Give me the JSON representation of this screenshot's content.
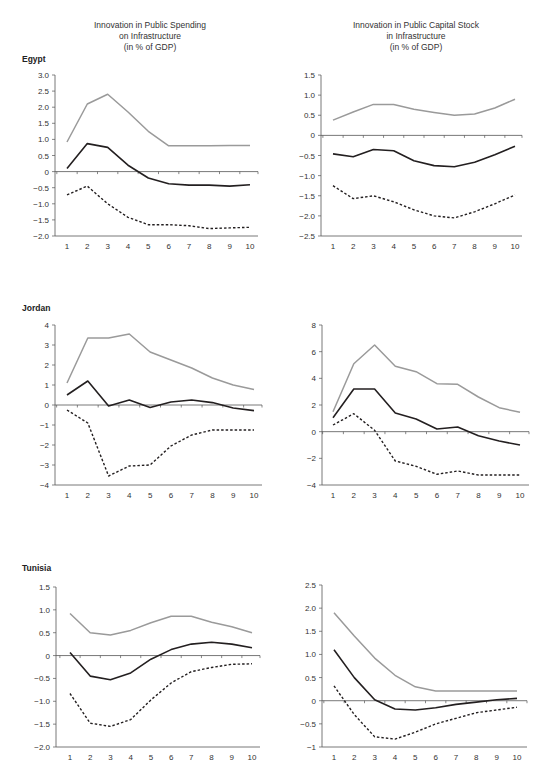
{
  "headers": {
    "left": [
      "Innovation in Public Spending",
      "on Infrastructure",
      "(in % of GDP)"
    ],
    "right": [
      "Innovation in Public Capital Stock",
      "in Infrastructure",
      "(in % of GDP)"
    ]
  },
  "countries": [
    "Egypt",
    "Jordan",
    "Tunisia"
  ],
  "colors": {
    "upper_band": "#9a9a9a",
    "estimate": "#231f20",
    "lower_band": "#231f20",
    "axis": "#555555"
  },
  "chart_data": [
    {
      "type": "line",
      "country": "Egypt",
      "panel": "Innovation in Public Spending on Infrastructure (in % of GDP)",
      "x": [
        1,
        2,
        3,
        4,
        5,
        6,
        7,
        8,
        9,
        10
      ],
      "ylim": [
        -2.0,
        3.0
      ],
      "yticks": [
        "3.0",
        "2.5",
        "2.0",
        "1.5",
        "1.0",
        "0.5",
        "0",
        "-0.5",
        "-1.0",
        "-1.5",
        "-2.0"
      ],
      "series": [
        {
          "name": "upper",
          "style": "gray",
          "values": [
            0.92,
            2.1,
            2.4,
            1.85,
            1.25,
            0.8,
            0.8,
            0.8,
            0.81,
            0.81
          ]
        },
        {
          "name": "estimate",
          "style": "solid",
          "values": [
            0.1,
            0.87,
            0.75,
            0.2,
            -0.2,
            -0.38,
            -0.42,
            -0.42,
            -0.45,
            -0.41
          ]
        },
        {
          "name": "lower",
          "style": "dashed",
          "values": [
            -0.72,
            -0.45,
            -1.0,
            -1.42,
            -1.65,
            -1.65,
            -1.68,
            -1.77,
            -1.75,
            -1.73
          ]
        }
      ],
      "frame": {
        "left": 55,
        "right": 258,
        "top": 75,
        "bottom": 236,
        "zero_line": true,
        "x_start": 67,
        "x_end": 250
      }
    },
    {
      "type": "line",
      "country": "Egypt",
      "panel": "Innovation in Public Capital Stock in Infrastructure (in % of GDP)",
      "x": [
        1,
        2,
        3,
        4,
        5,
        6,
        7,
        8,
        9,
        10
      ],
      "ylim": [
        -2.5,
        1.5
      ],
      "yticks": [
        "1.5",
        "1.0",
        "0.5",
        "0",
        "-0.5",
        "-1.0",
        "-1.5",
        "-2.0",
        "-2.5"
      ],
      "series": [
        {
          "name": "upper",
          "style": "gray",
          "values": [
            0.38,
            0.58,
            0.77,
            0.77,
            0.65,
            0.57,
            0.5,
            0.53,
            0.68,
            0.9
          ]
        },
        {
          "name": "estimate",
          "style": "solid",
          "values": [
            -0.46,
            -0.53,
            -0.35,
            -0.38,
            -0.63,
            -0.75,
            -0.78,
            -0.67,
            -0.48,
            -0.27
          ]
        },
        {
          "name": "lower",
          "style": "dashed",
          "values": [
            -1.25,
            -1.57,
            -1.5,
            -1.65,
            -1.85,
            -2.0,
            -2.05,
            -1.9,
            -1.7,
            -1.48
          ]
        }
      ],
      "frame": {
        "left": 321,
        "right": 522,
        "top": 75,
        "bottom": 236,
        "zero_line": true,
        "x_start": 333,
        "x_end": 515
      }
    },
    {
      "type": "line",
      "country": "Jordan",
      "panel": "Innovation in Public Spending on Infrastructure (in % of GDP)",
      "x": [
        1,
        2,
        3,
        4,
        5,
        6,
        7,
        8,
        9,
        10
      ],
      "ylim": [
        -4,
        4
      ],
      "yticks": [
        "4",
        "3",
        "2",
        "1",
        "0",
        "-1",
        "-2",
        "-3",
        "-4"
      ],
      "series": [
        {
          "name": "upper",
          "style": "gray",
          "values": [
            1.1,
            3.35,
            3.35,
            3.55,
            2.65,
            2.25,
            1.85,
            1.35,
            1.0,
            0.78
          ]
        },
        {
          "name": "estimate",
          "style": "solid",
          "values": [
            0.5,
            1.2,
            -0.05,
            0.25,
            -0.12,
            0.15,
            0.25,
            0.12,
            -0.15,
            -0.28
          ]
        },
        {
          "name": "lower",
          "style": "dashed",
          "values": [
            -0.25,
            -0.9,
            -3.55,
            -3.05,
            -3.0,
            -2.05,
            -1.5,
            -1.25,
            -1.25,
            -1.25
          ]
        }
      ],
      "frame": {
        "left": 55,
        "right": 262,
        "top": 325,
        "bottom": 485,
        "zero_line": true,
        "x_start": 67,
        "x_end": 254
      }
    },
    {
      "type": "line",
      "country": "Jordan",
      "panel": "Innovation in Public Capital Stock in Infrastructure (in % of GDP)",
      "x": [
        1,
        2,
        3,
        4,
        5,
        6,
        7,
        8,
        9,
        10
      ],
      "ylim": [
        -4,
        8
      ],
      "yticks": [
        "8",
        "6",
        "4",
        "2",
        "0",
        "-2",
        "-4"
      ],
      "series": [
        {
          "name": "upper",
          "style": "gray",
          "values": [
            1.5,
            5.1,
            6.5,
            4.9,
            4.5,
            3.6,
            3.55,
            2.6,
            1.8,
            1.45
          ]
        },
        {
          "name": "estimate",
          "style": "solid",
          "values": [
            1.05,
            3.2,
            3.2,
            1.4,
            0.95,
            0.2,
            0.35,
            -0.3,
            -0.7,
            -1.0
          ]
        },
        {
          "name": "lower",
          "style": "dashed",
          "values": [
            0.5,
            1.35,
            0.1,
            -2.2,
            -2.6,
            -3.2,
            -2.95,
            -3.25,
            -3.25,
            -3.25
          ]
        }
      ],
      "frame": {
        "left": 322,
        "right": 529,
        "top": 325,
        "bottom": 485,
        "zero_line": true,
        "x_start": 333,
        "x_end": 520
      }
    },
    {
      "type": "line",
      "country": "Tunisia",
      "panel": "Innovation in Public Spending on Infrastructure (in % of GDP)",
      "x": [
        1,
        2,
        3,
        4,
        5,
        6,
        7,
        8,
        9,
        10
      ],
      "ylim": [
        -2.0,
        1.5
      ],
      "yticks": [
        "1.5",
        "1.0",
        "0.5",
        "0",
        "-0.5",
        "-1.0",
        "-1.5",
        "-2.0"
      ],
      "series": [
        {
          "name": "upper",
          "style": "gray",
          "values": [
            0.92,
            0.5,
            0.45,
            0.55,
            0.72,
            0.86,
            0.86,
            0.73,
            0.63,
            0.5
          ]
        },
        {
          "name": "estimate",
          "style": "solid",
          "values": [
            0.07,
            -0.45,
            -0.53,
            -0.38,
            -0.08,
            0.13,
            0.25,
            0.29,
            0.25,
            0.17
          ]
        },
        {
          "name": "lower",
          "style": "dashed",
          "values": [
            -0.83,
            -1.48,
            -1.55,
            -1.4,
            -0.97,
            -0.6,
            -0.35,
            -0.26,
            -0.19,
            -0.18
          ]
        }
      ],
      "frame": {
        "left": 56,
        "right": 260,
        "top": 587,
        "bottom": 747,
        "zero_line": true,
        "x_start": 70,
        "x_end": 252
      }
    },
    {
      "type": "line",
      "country": "Tunisia",
      "panel": "Innovation in Public Capital Stock in Infrastructure (in % of GDP)",
      "x": [
        1,
        2,
        3,
        4,
        5,
        6,
        7,
        8,
        9,
        10
      ],
      "ylim": [
        -1,
        2.5
      ],
      "yticks": [
        "2.5",
        "2.0",
        "1.5",
        "1.0",
        "0.5",
        "0",
        "-0.5",
        "-1"
      ],
      "series": [
        {
          "name": "upper",
          "style": "gray",
          "values": [
            1.9,
            1.4,
            0.92,
            0.55,
            0.3,
            0.21,
            0.21,
            0.21,
            0.21,
            0.21
          ]
        },
        {
          "name": "estimate",
          "style": "solid",
          "values": [
            1.1,
            0.5,
            0.02,
            -0.18,
            -0.2,
            -0.15,
            -0.08,
            -0.03,
            0.02,
            0.05
          ]
        },
        {
          "name": "lower",
          "style": "dashed",
          "values": [
            0.32,
            -0.3,
            -0.78,
            -0.83,
            -0.68,
            -0.5,
            -0.38,
            -0.26,
            -0.2,
            -0.14
          ]
        }
      ],
      "frame": {
        "left": 322,
        "right": 527,
        "top": 585,
        "bottom": 747,
        "zero_line": true,
        "x_start": 334,
        "x_end": 517
      }
    }
  ]
}
